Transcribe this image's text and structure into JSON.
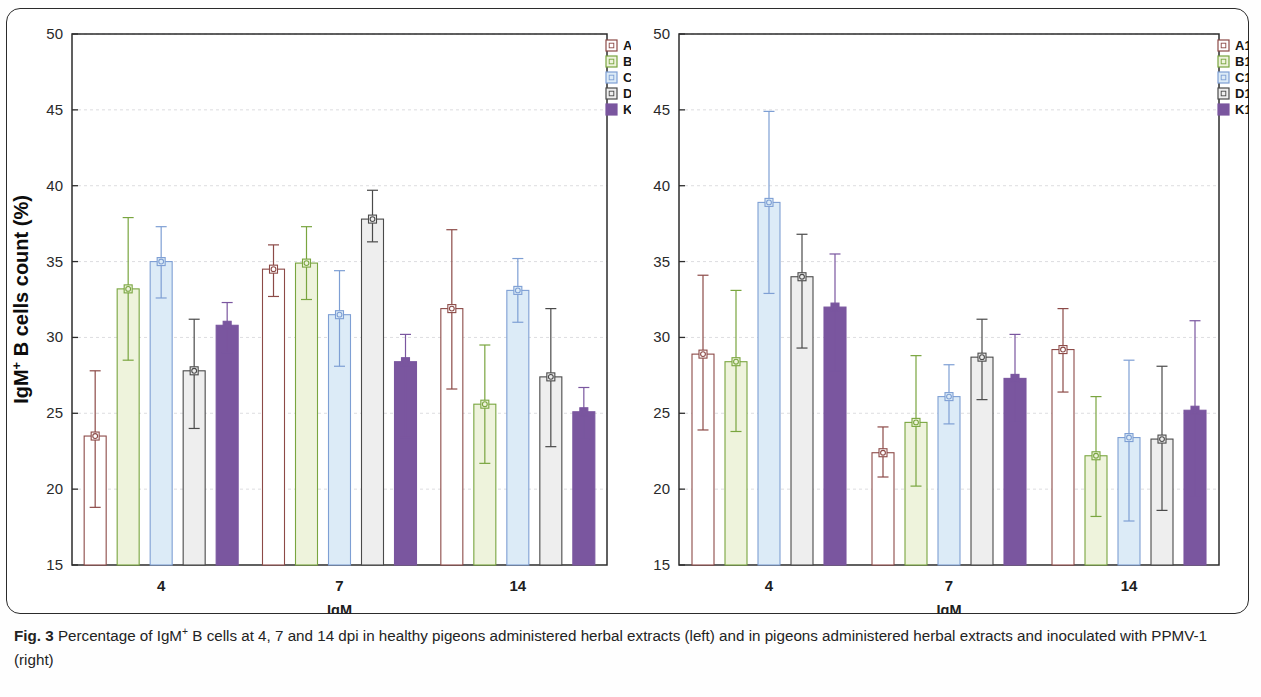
{
  "figure": {
    "label": "Fig. 3",
    "caption_text": "Percentage of IgM+ B cells at 4, 7 and 14 dpi in healthy pigeons administered herbal extracts (left) and in pigeons administered herbal extracts and inoculated with PPMV-1 (right)",
    "caption_part1": "Percentage of IgM",
    "caption_sup": "+",
    "caption_part2": " B cells at 4, 7 and 14 dpi in healthy pigeons administered herbal extracts (left) and in pigeons administered herbal extracts and inoculated with PPMV-1 (right)"
  },
  "palette": {
    "A": "#8c4a47",
    "B": "#79a53f",
    "C": "#7e9fd4",
    "D": "#4a4a4a",
    "K": "#7a569f",
    "A_fill": "#ffffff",
    "B_fill": "#eef3dc",
    "C_fill": "#dcebf7",
    "D_fill": "#eeeeee",
    "K_fill": "#7a569f",
    "axis": "#2d2d2d",
    "grid": "#d9d9dd",
    "frame": "#2b2b2b"
  },
  "chart_data": [
    {
      "id": "left",
      "type": "bar",
      "title": "",
      "xlabel": "IgM",
      "ylabel": "IgM+ B cells count (%)",
      "ylabel_main": "IgM",
      "ylabel_sup": "+",
      "ylabel_rest": " B cells count (%)",
      "categories": [
        "4",
        "7",
        "14"
      ],
      "ylim": [
        15,
        50
      ],
      "yticks": [
        15,
        20,
        25,
        30,
        35,
        40,
        45,
        50
      ],
      "grid": true,
      "legend_position": "top-right",
      "series": [
        {
          "name": "A",
          "color_key": "A",
          "values": [
            23.5,
            34.5,
            31.9
          ],
          "err_low": [
            18.8,
            32.7,
            26.6
          ],
          "err_high": [
            27.8,
            36.1,
            37.1
          ]
        },
        {
          "name": "B",
          "color_key": "B",
          "values": [
            33.2,
            34.9,
            25.6
          ],
          "err_low": [
            28.5,
            32.5,
            21.7
          ],
          "err_high": [
            37.9,
            37.3,
            29.5
          ]
        },
        {
          "name": "C",
          "color_key": "C",
          "values": [
            35.0,
            31.5,
            33.1
          ],
          "err_low": [
            32.6,
            28.1,
            31.0
          ],
          "err_high": [
            37.3,
            34.4,
            35.2
          ]
        },
        {
          "name": "D",
          "color_key": "D",
          "values": [
            27.8,
            37.8,
            27.4
          ],
          "err_low": [
            24.0,
            36.3,
            22.8
          ],
          "err_high": [
            31.2,
            39.7,
            31.9
          ]
        },
        {
          "name": "K",
          "color_key": "K",
          "values": [
            30.8,
            28.4,
            25.1
          ],
          "err_low": [
            29.0,
            23.4,
            23.3
          ],
          "err_high": [
            32.3,
            30.2,
            26.7
          ]
        }
      ]
    },
    {
      "id": "right",
      "type": "bar",
      "title": "",
      "xlabel": "IgM",
      "ylabel": "",
      "categories": [
        "4",
        "7",
        "14"
      ],
      "ylim": [
        15,
        50
      ],
      "yticks": [
        15,
        20,
        25,
        30,
        35,
        40,
        45,
        50
      ],
      "grid": true,
      "legend_position": "top-right",
      "series": [
        {
          "name": "A1",
          "color_key": "A",
          "values": [
            28.9,
            22.4,
            29.2
          ],
          "err_low": [
            23.9,
            20.8,
            26.4
          ],
          "err_high": [
            34.1,
            24.1,
            31.9
          ]
        },
        {
          "name": "B1",
          "color_key": "B",
          "values": [
            28.4,
            24.4,
            22.2
          ],
          "err_low": [
            23.8,
            20.2,
            18.2
          ],
          "err_high": [
            33.1,
            28.8,
            26.1
          ]
        },
        {
          "name": "C1",
          "color_key": "C",
          "values": [
            38.9,
            26.1,
            23.4
          ],
          "err_low": [
            32.9,
            24.3,
            17.9
          ],
          "err_high": [
            44.9,
            28.2,
            28.5
          ]
        },
        {
          "name": "D1",
          "color_key": "D",
          "values": [
            34.0,
            28.7,
            23.3
          ],
          "err_low": [
            29.3,
            25.9,
            18.6
          ],
          "err_high": [
            36.8,
            31.2,
            28.1
          ]
        },
        {
          "name": "K1",
          "color_key": "K",
          "values": [
            32.0,
            27.3,
            25.2
          ],
          "err_low": [
            27.8,
            24.4,
            19.5
          ],
          "err_high": [
            35.5,
            30.2,
            31.1
          ]
        }
      ]
    }
  ]
}
